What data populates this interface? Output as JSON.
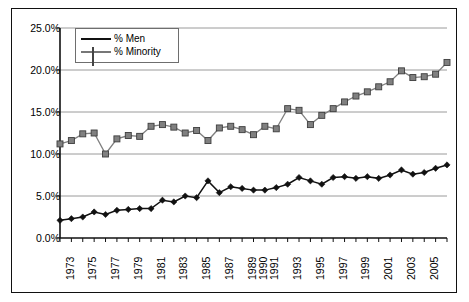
{
  "chart_data": {
    "type": "line",
    "title": "",
    "xlabel": "",
    "ylabel": "",
    "ylim": [
      0,
      25
    ],
    "ytick_labels": [
      "0.0%",
      "5.0%",
      "10.0%",
      "15.0%",
      "20.0%",
      "25.0%"
    ],
    "ytick_values": [
      0,
      5,
      10,
      15,
      20,
      25
    ],
    "grid": true,
    "legend_position": "upper-left-inside",
    "x": [
      1973,
      1974,
      1975,
      1976,
      1977,
      1978,
      1979,
      1980,
      1981,
      1982,
      1983,
      1984,
      1985,
      1986,
      1987,
      1988,
      1989,
      1990,
      1991,
      1992,
      1993,
      1994,
      1995,
      1996,
      1997,
      1998,
      1999,
      2000,
      2001,
      2002,
      2003,
      2004,
      2005,
      2006,
      2007
    ],
    "xtick_labels": [
      "1973",
      "",
      "1975",
      "",
      "1977",
      "",
      "1979",
      "",
      "1981",
      "",
      "1983",
      "",
      "1985",
      "",
      "1987",
      "",
      "1989",
      "1990",
      "1991",
      "",
      "1993",
      "",
      "1995",
      "",
      "1997",
      "",
      "1999",
      "",
      "2001",
      "",
      "2003",
      "",
      "2005",
      "",
      ""
    ],
    "series": [
      {
        "name": "% Men",
        "marker": "diamond",
        "color": "#111111",
        "values": [
          2.1,
          2.3,
          2.5,
          3.1,
          2.8,
          3.3,
          3.4,
          3.5,
          3.5,
          4.5,
          4.3,
          5.0,
          4.8,
          6.8,
          5.4,
          6.1,
          5.9,
          5.7,
          5.7,
          6.0,
          6.4,
          7.2,
          6.8,
          6.4,
          7.2,
          7.3,
          7.1,
          7.3,
          7.1,
          7.5,
          8.1,
          7.6,
          7.8,
          8.3,
          8.7
        ]
      },
      {
        "name": "% Minority",
        "marker": "square",
        "color": "#808080",
        "values": [
          11.2,
          11.6,
          12.4,
          12.5,
          10.0,
          11.8,
          12.2,
          12.1,
          13.3,
          13.5,
          13.2,
          12.5,
          12.8,
          11.6,
          13.1,
          13.3,
          12.9,
          12.3,
          13.3,
          13.0,
          15.4,
          15.2,
          13.5,
          14.6,
          15.4,
          16.2,
          16.9,
          17.4,
          18.0,
          18.6,
          19.9,
          19.1,
          19.2,
          19.5,
          20.9
        ]
      }
    ]
  },
  "legend": {
    "items": [
      {
        "label": "% Men"
      },
      {
        "label": "% Minority"
      }
    ]
  }
}
